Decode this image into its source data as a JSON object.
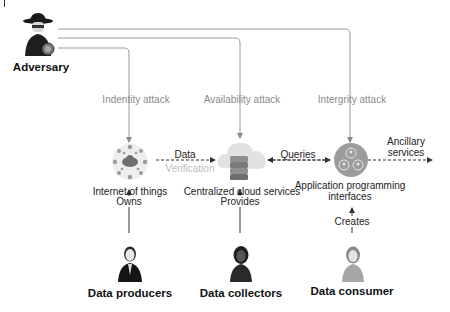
{
  "diagram": {
    "adversary": {
      "label": "Adversary",
      "icon": "spy-hacker-icon"
    },
    "attacks": [
      {
        "label": "Indentity attack",
        "target": "Internet of things"
      },
      {
        "label": "Availability attack",
        "target": "Centralized cloud services"
      },
      {
        "label": "Intergrity attack",
        "target": "Application programming interfaces"
      }
    ],
    "nodes": [
      {
        "label": "Internet of things",
        "icon": "iot-network-icon"
      },
      {
        "label": "Centralized cloud services",
        "icon": "cloud-server-icon"
      },
      {
        "label_line1": "Application programming",
        "label_line2": "interfaces",
        "icon": "api-users-icon"
      }
    ],
    "flows": {
      "data": "Data",
      "verification": "Verification",
      "queries": "Queries",
      "ancillary_line1": "Ancillary",
      "ancillary_line2": "services"
    },
    "relations": [
      "Owns",
      "Provides",
      "Creates"
    ],
    "actors": [
      {
        "label": "Data producers",
        "icon": "businessman-icon"
      },
      {
        "label": "Data collectors",
        "icon": "businesswoman-icon"
      },
      {
        "label": "Data consumer",
        "icon": "woman-icon"
      }
    ],
    "colors": {
      "line": "#9a9a9a",
      "arrow": "#333333",
      "attack_text": "#8a8a8a",
      "verification_text": "#bdbdbd"
    }
  }
}
